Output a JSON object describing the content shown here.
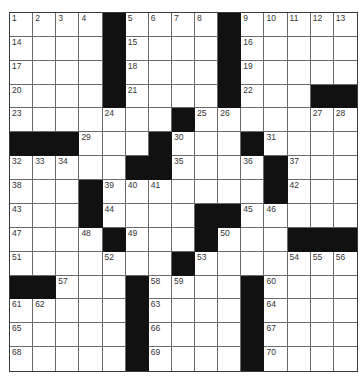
{
  "puzzle": {
    "rows": 15,
    "cols": 15,
    "colors": {
      "black_square": "#111111",
      "grid_line": "#6a6a6a",
      "border": "#3a3a3a",
      "number_text": "#333333"
    },
    "grid": [
      [
        "1",
        "2",
        "3",
        "4",
        "#",
        "5",
        "6",
        "7",
        "8",
        "#",
        "9",
        "10",
        "11",
        "12",
        "13"
      ],
      [
        "14",
        "",
        "",
        "",
        "#",
        "15",
        "",
        "",
        "",
        "#",
        "16",
        "",
        "",
        "",
        ""
      ],
      [
        "17",
        "",
        "",
        "",
        "#",
        "18",
        "",
        "",
        "",
        "#",
        "19",
        "",
        "",
        "",
        ""
      ],
      [
        "20",
        "",
        "",
        "",
        "#",
        "21",
        "",
        "",
        "",
        "#",
        "22",
        "",
        "",
        "#",
        "#"
      ],
      [
        "23",
        "",
        "",
        "",
        "24",
        "",
        "",
        "#",
        "25",
        "26",
        "",
        "",
        "",
        "27",
        "28"
      ],
      [
        "#",
        "#",
        "#",
        "29",
        "",
        "",
        "#",
        "30",
        "",
        "",
        "#",
        "31",
        "",
        "",
        ""
      ],
      [
        "32",
        "33",
        "34",
        "",
        "",
        "#",
        "#",
        "35",
        "",
        "",
        "36",
        "#",
        "37",
        "",
        ""
      ],
      [
        "38",
        "",
        "",
        "#",
        "39",
        "40",
        "41",
        "",
        "",
        "",
        "",
        "#",
        "42",
        "",
        ""
      ],
      [
        "43",
        "",
        "",
        "#",
        "44",
        "",
        "",
        "",
        "#",
        "#",
        "45",
        "46",
        "",
        "",
        ""
      ],
      [
        "47",
        "",
        "",
        "48",
        "#",
        "49",
        "",
        "",
        "#",
        "50",
        "",
        "",
        "#",
        "#",
        "#"
      ],
      [
        "51",
        "",
        "",
        "",
        "52",
        "",
        "",
        "#",
        "53",
        "",
        "",
        "",
        "54",
        "55",
        "56"
      ],
      [
        "#",
        "#",
        "57",
        "",
        "",
        "#",
        "58",
        "59",
        "",
        "",
        "#",
        "60",
        "",
        "",
        ""
      ],
      [
        "61",
        "62",
        "",
        "",
        "",
        "#",
        "63",
        "",
        "",
        "",
        "#",
        "64",
        "",
        "",
        ""
      ],
      [
        "65",
        "",
        "",
        "",
        "",
        "#",
        "66",
        "",
        "",
        "",
        "#",
        "67",
        "",
        "",
        ""
      ],
      [
        "68",
        "",
        "",
        "",
        "",
        "#",
        "69",
        "",
        "",
        "",
        "#",
        "70",
        "",
        "",
        ""
      ]
    ]
  }
}
